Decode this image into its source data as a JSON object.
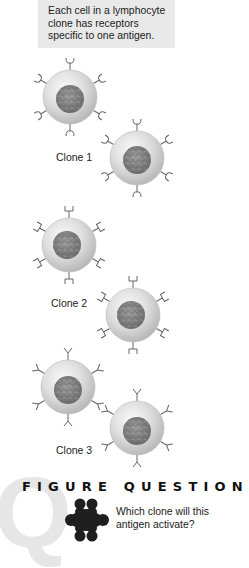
{
  "caption": {
    "lines": [
      "Each cell in a lymphocyte",
      "clone has receptors",
      "specific to one antigen."
    ],
    "background": "#e9e9e9"
  },
  "clones": [
    {
      "label": "Clone 1",
      "receptor_shape": "rounded-cup",
      "cells": [
        {
          "cx": 70,
          "cy": 97
        },
        {
          "cx": 137,
          "cy": 158
        }
      ]
    },
    {
      "label": "Clone 2",
      "receptor_shape": "square-cup",
      "cells": [
        {
          "cx": 69,
          "cy": 245
        },
        {
          "cx": 133,
          "cy": 315
        }
      ]
    },
    {
      "label": "Clone 3",
      "receptor_shape": "v-shape",
      "cells": [
        {
          "cx": 68,
          "cy": 387
        },
        {
          "cx": 137,
          "cy": 428
        }
      ]
    }
  ],
  "figure_question": {
    "watermark": "Q",
    "heading": "FIGURE QUESTION",
    "antigen_icon": "antigen-cluster-icon",
    "question_lines": [
      "Which clone will this",
      "antigen activate?"
    ]
  }
}
